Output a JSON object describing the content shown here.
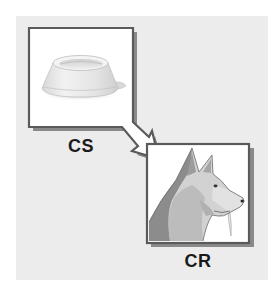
{
  "diagram": {
    "type": "classical-conditioning",
    "nodes": [
      {
        "id": "stimulus",
        "label": "CS",
        "image": "dog-food-bowl",
        "icon": "bowl-icon"
      },
      {
        "id": "response",
        "label": "CR",
        "image": "salivating-dog",
        "icon": "dog-icon"
      }
    ],
    "edges": [
      {
        "from": "stimulus",
        "to": "response",
        "style": "hollow-arrow"
      }
    ]
  },
  "colors": {
    "panel_background": "#ececec",
    "frame_border": "#5a5a5a",
    "frame_shadow": "#8a8a8a",
    "frame_fill": "#ffffff",
    "dog_dark": "#8c8c8c",
    "dog_mid": "#b4b4b4",
    "dog_light": "#d6d6d6",
    "label_text": "#1a1a1a"
  }
}
